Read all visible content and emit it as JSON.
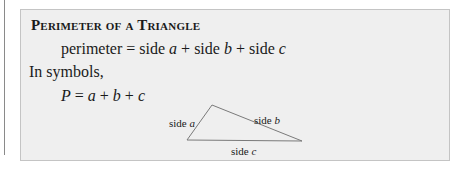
{
  "box": {
    "title": "Perimeter of a Triangle",
    "formula_words": {
      "lhs": "perimeter",
      "eq": " = ",
      "t1": "side ",
      "v1": "a",
      "plus1": " + ",
      "t2": "side ",
      "v2": "b",
      "plus2": " + ",
      "t3": "side ",
      "v3": "c"
    },
    "intro": "In symbols,",
    "formula_symbols": {
      "lhs": "P",
      "eq": " = ",
      "v1": "a",
      "plus1": " + ",
      "v2": "b",
      "plus2": " + ",
      "v3": "c"
    }
  },
  "diagram": {
    "labels": {
      "a_text": "side ",
      "a_var": "a",
      "b_text": "side ",
      "b_var": "b",
      "c_text": "side ",
      "c_var": "c"
    },
    "colors": {
      "stroke": "#7a7a7a",
      "fill": "#efefef",
      "border": "#c4c4c4"
    }
  }
}
